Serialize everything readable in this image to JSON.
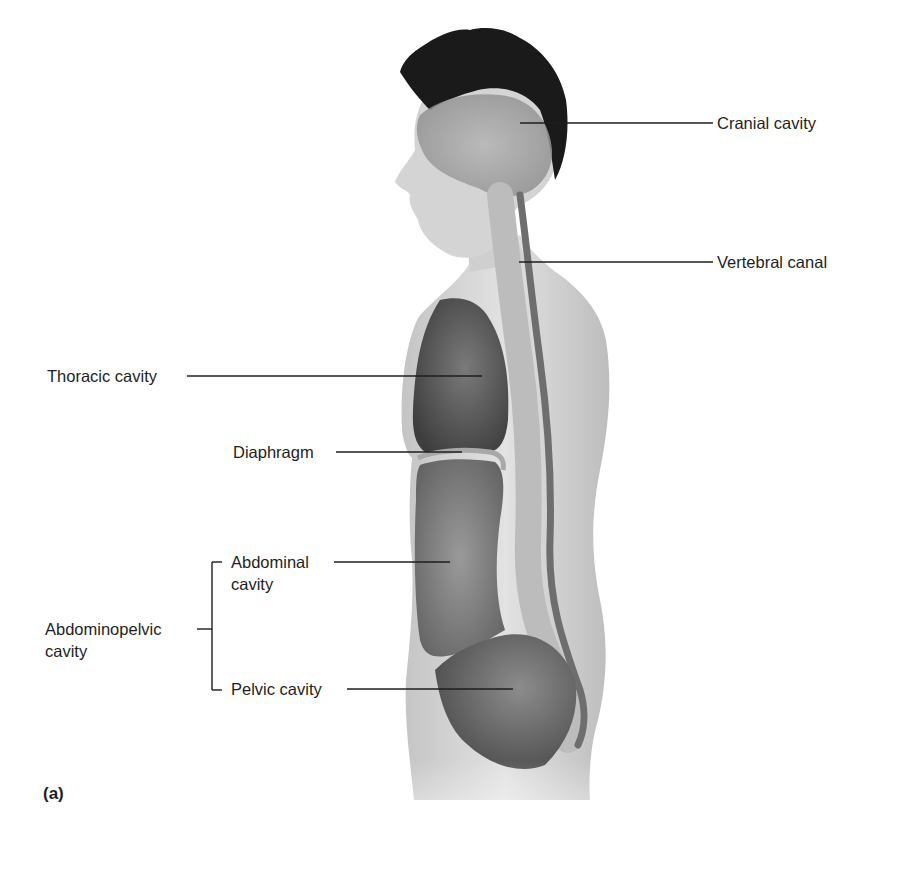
{
  "figure": {
    "panel_label": "(a)",
    "colors": {
      "background": "#ffffff",
      "skin": "#d9d9d9",
      "cavity_dark": "#5a5a5a",
      "cavity_mid": "#8a8a8a",
      "hair": "#1a1a1a",
      "leader_line": "#1e1e1e",
      "text": "#1e1e1e"
    },
    "labels": {
      "cranial": "Cranial cavity",
      "vertebral": "Vertebral canal",
      "thoracic": "Thoracic cavity",
      "diaphragm": "Diaphragm",
      "abdominal_line1": "Abdominal",
      "abdominal_line2": "cavity",
      "abdominopelvic_line1": "Abdominopelvic",
      "abdominopelvic_line2": "cavity",
      "pelvic": "Pelvic cavity"
    }
  }
}
